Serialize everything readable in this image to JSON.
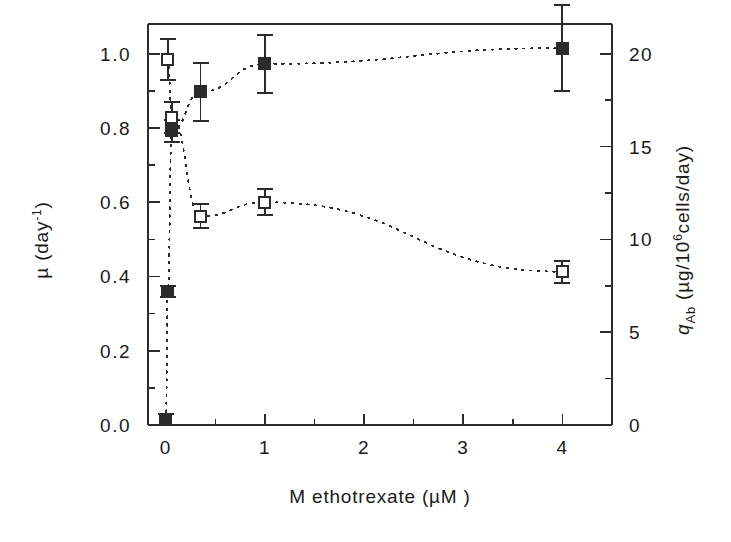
{
  "chart_data": {
    "type": "scatter",
    "title": "",
    "xlabel": "M ethotrexate (µM )",
    "ylabel_left": "µ (day-1)",
    "ylabel_right": "q_Ab (µg/10⁶6cells/day)",
    "xlim": [
      -0.18,
      4.5
    ],
    "ylim_left": [
      0.0,
      1.08
    ],
    "ylim_right": [
      0.0,
      21.6
    ],
    "xticks": [
      0,
      1,
      2,
      3,
      4
    ],
    "xticklabels": [
      "0",
      "1",
      "2",
      "3",
      "4"
    ],
    "yticks_left": [
      0.0,
      0.2,
      0.4,
      0.6,
      0.8,
      1.0
    ],
    "yticklabels_left": [
      "0.0",
      "0.2",
      "0.4",
      "0.6",
      "0.8",
      "1.0"
    ],
    "yticks_right": [
      0,
      5,
      10,
      15,
      20
    ],
    "yticklabels_right": [
      "0",
      "5",
      "10",
      "15",
      "20"
    ],
    "minor_ticks_left": [
      0.1,
      0.3,
      0.5,
      0.7,
      0.9
    ],
    "minor_ticks_right": [
      2.5,
      7.5,
      12.5,
      17.5
    ],
    "grid": false,
    "legend": false,
    "series": [
      {
        "name": "mu",
        "marker": "open-square",
        "axis": "left",
        "line": "dotted",
        "points": [
          {
            "x": 0.02,
            "y": 0.985,
            "err": 0.055
          },
          {
            "x": 0.06,
            "y": 0.828,
            "err": 0.042
          },
          {
            "x": 0.35,
            "y": 0.562,
            "err": 0.032
          },
          {
            "x": 1.0,
            "y": 0.6,
            "err": 0.035
          },
          {
            "x": 4.0,
            "y": 0.413,
            "err": 0.03
          }
        ]
      },
      {
        "name": "qAb",
        "marker": "filled-square",
        "axis": "right",
        "line": "dotted",
        "points": [
          {
            "x": 0.0,
            "y": 0.3,
            "err": 0.3
          },
          {
            "x": 0.02,
            "y": 7.2,
            "err": 0.3
          },
          {
            "x": 0.06,
            "y": 15.85,
            "err": 0.6
          },
          {
            "x": 0.35,
            "y": 17.95,
            "err": 1.55
          },
          {
            "x": 1.0,
            "y": 19.45,
            "err": 1.55
          },
          {
            "x": 4.0,
            "y": 20.3,
            "err": 2.3
          }
        ]
      }
    ]
  },
  "axes": {
    "left_label_mu": "µ",
    "left_label_rest": " (day",
    "left_label_sup": "-1",
    "left_label_close": ")",
    "right_label_q": "q",
    "right_label_sub": "Ab",
    "right_label_rest": " (µg/10",
    "right_label_sup": "6",
    "right_label_tail": "cells/day)",
    "xlabel": "M ethotrexate (µM )"
  }
}
